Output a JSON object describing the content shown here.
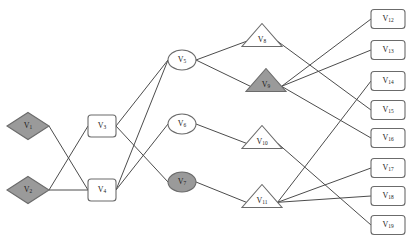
{
  "diagram": {
    "background_color": "#ffffff",
    "edge_color": "#4c4c4c",
    "node_outline_color": "#6b6b6b",
    "node_fill_white": "#ffffff",
    "node_fill_shaded": "#9a9a9a",
    "label_color": "#1a1a1a"
  },
  "nodes": [
    {
      "id": "V1",
      "base": "V",
      "sub": "1",
      "shape": "diamond",
      "shaded": true,
      "x": 28,
      "y": 126,
      "w": 42,
      "h": 27,
      "label": "V1"
    },
    {
      "id": "V2",
      "base": "V",
      "sub": "2",
      "shape": "diamond",
      "shaded": true,
      "x": 28,
      "y": 190,
      "w": 42,
      "h": 27,
      "label": "V2"
    },
    {
      "id": "V3",
      "base": "V",
      "sub": "3",
      "shape": "rounded-rect",
      "shaded": false,
      "x": 102,
      "y": 126,
      "w": 28,
      "h": 22,
      "label": "V3"
    },
    {
      "id": "V4",
      "base": "V",
      "sub": "4",
      "shape": "rounded-rect",
      "shaded": false,
      "x": 102,
      "y": 190,
      "w": 28,
      "h": 22,
      "label": "V4"
    },
    {
      "id": "V5",
      "base": "V",
      "sub": "5",
      "shape": "ellipse",
      "shaded": false,
      "x": 182,
      "y": 60,
      "w": 28,
      "h": 20,
      "label": "V5"
    },
    {
      "id": "V6",
      "base": "V",
      "sub": "6",
      "shape": "ellipse",
      "shaded": false,
      "x": 182,
      "y": 124,
      "w": 28,
      "h": 20,
      "label": "V6"
    },
    {
      "id": "V7",
      "base": "V",
      "sub": "7",
      "shape": "ellipse",
      "shaded": true,
      "x": 182,
      "y": 182,
      "w": 28,
      "h": 20,
      "label": "V7"
    },
    {
      "id": "V8",
      "base": "V",
      "sub": "8",
      "shape": "triangle",
      "shaded": false,
      "x": 262,
      "y": 35,
      "w": 40,
      "h": 23,
      "label": "V8"
    },
    {
      "id": "V9",
      "base": "V",
      "sub": "9",
      "shape": "triangle",
      "shaded": true,
      "x": 266,
      "y": 80,
      "w": 40,
      "h": 23,
      "label": "V9"
    },
    {
      "id": "V10",
      "base": "V",
      "sub": "10",
      "shape": "triangle",
      "shaded": false,
      "x": 262,
      "y": 137,
      "w": 40,
      "h": 23,
      "label": "V10"
    },
    {
      "id": "V11",
      "base": "V",
      "sub": "11",
      "shape": "triangle",
      "shaded": false,
      "x": 262,
      "y": 196,
      "w": 40,
      "h": 23,
      "label": "V11"
    },
    {
      "id": "V12",
      "base": "V",
      "sub": "12",
      "shape": "rounded-rect",
      "shaded": false,
      "x": 388,
      "y": 19,
      "w": 34,
      "h": 19,
      "label": "V12"
    },
    {
      "id": "V13",
      "base": "V",
      "sub": "13",
      "shape": "rounded-rect",
      "shaded": false,
      "x": 388,
      "y": 50,
      "w": 34,
      "h": 19,
      "label": "V13"
    },
    {
      "id": "V14",
      "base": "V",
      "sub": "14",
      "shape": "rounded-rect",
      "shaded": false,
      "x": 388,
      "y": 81,
      "w": 34,
      "h": 19,
      "label": "V14"
    },
    {
      "id": "V15",
      "base": "V",
      "sub": "15",
      "shape": "rounded-rect",
      "shaded": false,
      "x": 388,
      "y": 110,
      "w": 34,
      "h": 19,
      "label": "V15"
    },
    {
      "id": "V16",
      "base": "V",
      "sub": "16",
      "shape": "rounded-rect",
      "shaded": false,
      "x": 388,
      "y": 138,
      "w": 34,
      "h": 19,
      "label": "V16"
    },
    {
      "id": "V17",
      "base": "V",
      "sub": "17",
      "shape": "rounded-rect",
      "shaded": false,
      "x": 388,
      "y": 168,
      "w": 34,
      "h": 19,
      "label": "V17"
    },
    {
      "id": "V18",
      "base": "V",
      "sub": "18",
      "shape": "rounded-rect",
      "shaded": false,
      "x": 388,
      "y": 196,
      "w": 34,
      "h": 19,
      "label": "V18"
    },
    {
      "id": "V19",
      "base": "V",
      "sub": "19",
      "shape": "rounded-rect",
      "shaded": false,
      "x": 388,
      "y": 225,
      "w": 34,
      "h": 19,
      "label": "V19"
    }
  ],
  "edges": [
    {
      "from": "V1",
      "to": "V4"
    },
    {
      "from": "V2",
      "to": "V3"
    },
    {
      "from": "V2",
      "to": "V4"
    },
    {
      "from": "V3",
      "to": "V5"
    },
    {
      "from": "V3",
      "to": "V7"
    },
    {
      "from": "V4",
      "to": "V5"
    },
    {
      "from": "V4",
      "to": "V6"
    },
    {
      "from": "V5",
      "to": "V8"
    },
    {
      "from": "V5",
      "to": "V9"
    },
    {
      "from": "V6",
      "to": "V10"
    },
    {
      "from": "V7",
      "to": "V11"
    },
    {
      "from": "V8",
      "to": "V15"
    },
    {
      "from": "V9",
      "to": "V12"
    },
    {
      "from": "V9",
      "to": "V13"
    },
    {
      "from": "V9",
      "to": "V16"
    },
    {
      "from": "V10",
      "to": "V19"
    },
    {
      "from": "V11",
      "to": "V14"
    },
    {
      "from": "V11",
      "to": "V17"
    },
    {
      "from": "V11",
      "to": "V18"
    }
  ]
}
